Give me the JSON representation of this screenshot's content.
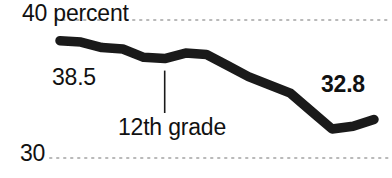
{
  "chart_data": {
    "type": "line",
    "title": "",
    "subtitle": "",
    "xlabel": "",
    "ylabel": "percent",
    "ylim": [
      30,
      40
    ],
    "grid": true,
    "legend_position": "none",
    "series": [
      {
        "name": "12th grade",
        "x": [
          0,
          1,
          2,
          3,
          4,
          5,
          6,
          7,
          8,
          9,
          10,
          11,
          12,
          13,
          14,
          15
        ],
        "values": [
          38.5,
          38.4,
          38.0,
          37.9,
          37.3,
          37.2,
          37.6,
          37.5,
          36.7,
          35.9,
          35.3,
          34.7,
          33.4,
          32.1,
          32.3,
          32.8
        ]
      }
    ],
    "axis_ticks": [
      {
        "value": 40,
        "label": "40 percent"
      },
      {
        "value": 30,
        "label": "30"
      }
    ],
    "point_labels": [
      {
        "text": "38.5",
        "value": 38.5,
        "anchor": "start",
        "bold": false
      },
      {
        "text": "32.8",
        "value": 32.8,
        "anchor": "end",
        "bold": true
      }
    ],
    "annotations": [
      {
        "text": "12th grade",
        "leader": true,
        "attach_x": 5,
        "attach_value": 37.2
      }
    ],
    "colors": {
      "line": "#1a1a1a",
      "gridline": "#b9b9b9",
      "text": "#111111",
      "background": "#ffffff",
      "leader": "#1a1a1a"
    }
  },
  "axis": {
    "top_label": "40 percent",
    "bottom_label": "30"
  },
  "values": {
    "start": "38.5",
    "end": "32.8"
  },
  "annotation": {
    "label": "12th grade"
  }
}
